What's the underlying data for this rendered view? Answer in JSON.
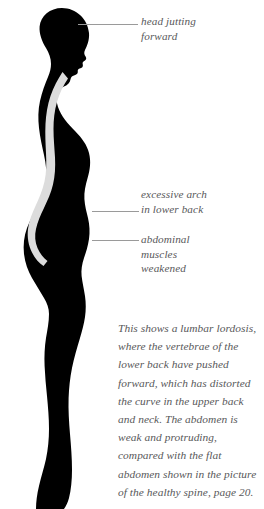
{
  "figure": {
    "name": "lumbar-lordosis-posture-silhouette",
    "silhouette_color": "#000000",
    "spine_color": "#dcdcdc",
    "background_color": "#ffffff"
  },
  "leader_color": "#9a9a9a",
  "text_color": "#58585a",
  "callouts": [
    {
      "id": "head",
      "label": "head jutting\nforward"
    },
    {
      "id": "arch",
      "label": "excessive arch\nin lower back"
    },
    {
      "id": "abdomen",
      "label": "abdominal\nmuscles\nweakened"
    }
  ],
  "caption": {
    "text": "This shows a lumbar lordosis, where the vertebrae of the lower back have pushed forward, which has distorted the curve in the upper back and neck. The abdomen is weak and protruding, compared with the flat abdomen shown in the picture of the healthy spine, page 20."
  }
}
